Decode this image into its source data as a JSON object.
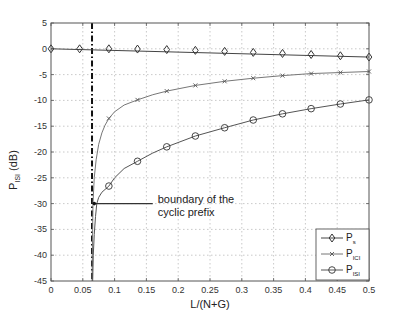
{
  "chart_data": {
    "type": "line",
    "title": "",
    "xlabel": "L/(N+G)",
    "ylabel": "P_ISI (dB)",
    "ylabel_main": "P",
    "ylabel_sub": "ISI",
    "ylabel_unit": " (dB)",
    "xlim": [
      0,
      0.5
    ],
    "ylim": [
      -45,
      5
    ],
    "grid": true,
    "xticks": [
      0,
      0.05,
      0.1,
      0.15,
      0.2,
      0.25,
      0.3,
      0.35,
      0.4,
      0.45,
      0.5
    ],
    "xtick_labels": [
      "0",
      "0.05",
      "0.1",
      "0.15",
      "0.2",
      "0.25",
      "0.3",
      "0.35",
      "0.4",
      "0.45",
      "0.5"
    ],
    "yticks": [
      5,
      0,
      -5,
      -10,
      -15,
      -20,
      -25,
      -30,
      -35,
      -40,
      -45
    ],
    "ytick_labels": [
      "5",
      "0",
      "-5",
      "-10",
      "-15",
      "-20",
      "-25",
      "-30",
      "-35",
      "-40",
      "-45"
    ],
    "legend_position": "lower right",
    "series": [
      {
        "name": "P_s",
        "label_main": "P",
        "label_sub": "s",
        "marker": "diamond",
        "color": "#444444",
        "x": [
          0,
          0.045,
          0.091,
          0.136,
          0.182,
          0.227,
          0.273,
          0.318,
          0.364,
          0.409,
          0.455,
          0.5
        ],
        "values": [
          0,
          0,
          0,
          -0.05,
          -0.15,
          -0.3,
          -0.5,
          -0.7,
          -0.9,
          -1.1,
          -1.35,
          -1.6
        ],
        "curve_x": [
          0,
          0.5
        ],
        "curve_y": [
          0,
          -1.6
        ]
      },
      {
        "name": "P_ICI",
        "label_main": "P",
        "label_sub": "ICI",
        "marker": "x",
        "color": "#777777",
        "x": [
          0.091,
          0.136,
          0.182,
          0.227,
          0.273,
          0.318,
          0.364,
          0.409,
          0.455,
          0.5
        ],
        "values": [
          -13.5,
          -9.9,
          -8.2,
          -7.1,
          -6.3,
          -5.7,
          -5.2,
          -4.8,
          -4.6,
          -4.4
        ],
        "curve_x": [
          0.0645,
          0.066,
          0.068,
          0.071,
          0.075,
          0.08,
          0.085,
          0.091,
          0.1,
          0.115,
          0.136,
          0.16,
          0.182,
          0.227,
          0.273,
          0.318,
          0.364,
          0.409,
          0.455,
          0.5
        ],
        "curve_y": [
          -45,
          -30,
          -25,
          -21.5,
          -18.5,
          -16.3,
          -14.8,
          -13.5,
          -12.2,
          -10.9,
          -9.9,
          -8.9,
          -8.2,
          -7.1,
          -6.3,
          -5.7,
          -5.2,
          -4.8,
          -4.6,
          -4.4
        ]
      },
      {
        "name": "P_ISI",
        "label_main": "P",
        "label_sub": "ISI",
        "marker": "circle",
        "color": "#555555",
        "x": [
          0.091,
          0.136,
          0.182,
          0.227,
          0.273,
          0.318,
          0.364,
          0.409,
          0.455,
          0.5
        ],
        "values": [
          -26.6,
          -21.8,
          -19.0,
          -16.9,
          -15.3,
          -13.8,
          -12.6,
          -11.6,
          -10.7,
          -9.9
        ],
        "curve_x": [
          0.0655,
          0.0665,
          0.068,
          0.07,
          0.072,
          0.075,
          0.08,
          0.091,
          0.1,
          0.115,
          0.136,
          0.16,
          0.182,
          0.227,
          0.273,
          0.318,
          0.364,
          0.409,
          0.455,
          0.5
        ],
        "curve_y": [
          -45,
          -40,
          -36,
          -32.5,
          -30,
          -28.8,
          -27.8,
          -26.6,
          -25,
          -23.2,
          -21.8,
          -20.2,
          -19.0,
          -16.9,
          -15.3,
          -13.8,
          -12.6,
          -11.6,
          -10.7,
          -9.9
        ]
      }
    ],
    "vertical_line": {
      "x": 0.0645,
      "style": "dash-dot",
      "color": "#111111",
      "label": "boundary of the cyclic prefix"
    },
    "annotation": {
      "line1": "boundary of the",
      "line2": "cyclic prefix",
      "arrow_from_x": 0.16,
      "arrow_to_x": 0.068,
      "arrow_y": -30
    }
  }
}
